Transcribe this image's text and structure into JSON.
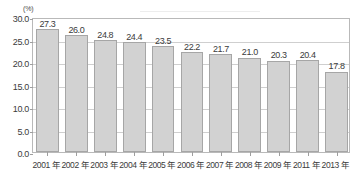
{
  "chart_data": {
    "type": "bar",
    "title": "",
    "subtitle": "",
    "xlabel": "",
    "ylabel": "(%)",
    "unit_label": "(%)",
    "categories": [
      "2001 年",
      "2002 年",
      "2003 年",
      "2004 年",
      "2005 年",
      "2006 年",
      "2007 年",
      "2008 年",
      "2009 年",
      "2011 年",
      "2013 年"
    ],
    "values": [
      27.3,
      26.0,
      24.8,
      24.4,
      23.5,
      22.2,
      21.7,
      21.0,
      20.3,
      20.4,
      17.8
    ],
    "value_labels": [
      "27.3",
      "26.0",
      "24.8",
      "24.4",
      "23.5",
      "22.2",
      "21.7",
      "21.0",
      "20.3",
      "20.4",
      "17.8"
    ],
    "ylim": [
      0.0,
      30.0
    ],
    "ytick_values": [
      0.0,
      5.0,
      10.0,
      15.0,
      20.0,
      25.0,
      30.0
    ],
    "ytick_labels": [
      "0.0",
      "5.0",
      "10.0",
      "15.0",
      "20.0",
      "25.0",
      "30.0"
    ],
    "grid": true,
    "legend": "none",
    "legend_position": "none",
    "bar_color": "#d2d2d2",
    "bar_border_color": "#a6a6a6",
    "grid_color": "#cfcfcf",
    "axis_color": "#b9b9b9",
    "text_color": "#3b3b3b"
  }
}
